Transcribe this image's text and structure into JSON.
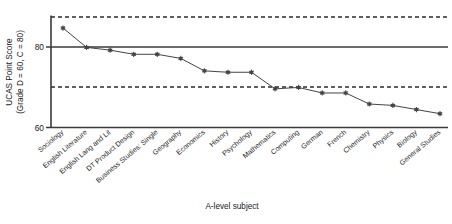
{
  "chart_data": {
    "type": "line",
    "title": "",
    "xlabel": "A-level subject",
    "ylabel": "UCAS Point Score\n(Grade D = 60, C = 80)",
    "ylabel_line1": "UCAS Point Score",
    "ylabel_line2": "(Grade D = 60, C = 80)",
    "categories": [
      "Sociology",
      "English Literature",
      "English Lang and Lit",
      "DT Product Design",
      "Business Studies: Single",
      "Geography",
      "Economics",
      "History",
      "Psychology",
      "Mathematics",
      "Computing",
      "German",
      "French",
      "Chemistry",
      "Physics",
      "Biology",
      "General Studies"
    ],
    "values": [
      96,
      89,
      88,
      86.5,
      86.5,
      85,
      80.5,
      80,
      80,
      74,
      74.5,
      72.5,
      72.5,
      68.5,
      68,
      66.5,
      65
    ],
    "ylim": [
      60,
      100
    ],
    "ytick_values": [
      80,
      60
    ],
    "ytick_labels": [
      "80",
      "60"
    ],
    "grid": false,
    "legend": null,
    "reference_lines": [
      {
        "name": "upper-dashed-reference",
        "value": 100,
        "style": "dashed"
      },
      {
        "name": "grade-c-solid-reference",
        "value": 80,
        "style": "solid"
      },
      {
        "name": "lower-dashed-reference",
        "value": 67,
        "style": "dashed"
      }
    ],
    "marker": "asterisk",
    "line_color": "#3a3a3a",
    "marker_color": "#444444"
  }
}
